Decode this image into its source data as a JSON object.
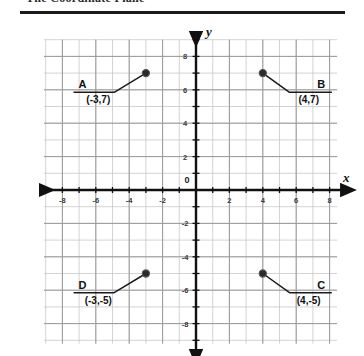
{
  "header": {
    "title": "The Coordinate Plane",
    "rule_color": "#1b1b1b"
  },
  "colors": {
    "grid_minor": "#c8c8c8",
    "grid_major": "#9a9a9a",
    "axis": "#111111",
    "point": "#2b2b2b",
    "leader": "#1b1b1b",
    "text": "#111111"
  },
  "chart_data": {
    "type": "scatter",
    "title": "The Coordinate Plane",
    "xlabel": "x",
    "ylabel": "y",
    "xlim": [
      -9,
      9
    ],
    "ylim": [
      -9,
      9
    ],
    "grid": true,
    "legend": "none",
    "origin_label": "0",
    "x_ticks": [
      -8,
      -6,
      -4,
      -2,
      2,
      4,
      6,
      8
    ],
    "x_tick_labels": [
      "-8",
      "-6",
      "-4",
      "-2",
      "2",
      "4",
      "6",
      "8"
    ],
    "y_ticks": [
      8,
      6,
      4,
      2,
      -2,
      -4,
      -6,
      -8
    ],
    "y_tick_labels": [
      "8",
      "6",
      "4",
      "2",
      "-2",
      "-4",
      "-6",
      "-8"
    ],
    "points": [
      {
        "label": "A",
        "coord_text": "(-3,7)",
        "x": -3,
        "y": 7,
        "label_side": "left"
      },
      {
        "label": "B",
        "coord_text": "(4,7)",
        "x": 4,
        "y": 7,
        "label_side": "right"
      },
      {
        "label": "C",
        "coord_text": "(4,-5)",
        "x": 4,
        "y": -5,
        "label_side": "right"
      },
      {
        "label": "D",
        "coord_text": "(-3,-5)",
        "x": -3,
        "y": -5,
        "label_side": "left"
      }
    ]
  }
}
